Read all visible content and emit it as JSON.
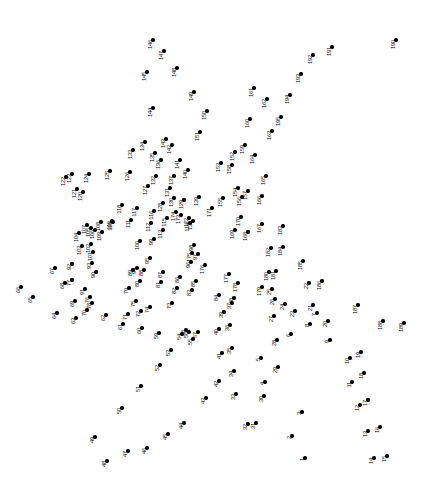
{
  "puzzle": {
    "type": "connect-the-dots",
    "title": "Connect the Dots",
    "total_points": 195,
    "canvas": {
      "width": 426,
      "height": 482
    },
    "dot_color": "#000000",
    "label_color": "#000000",
    "background_color": "#ffffff",
    "label_rotation_deg": -90,
    "points": [
      {
        "n": "1",
        "x": 305,
        "y": 458
      },
      {
        "n": "2",
        "x": 292,
        "y": 436
      },
      {
        "n": "3",
        "x": 302,
        "y": 412
      },
      {
        "n": "4",
        "x": 265,
        "y": 382
      },
      {
        "n": "5",
        "x": 261,
        "y": 358
      },
      {
        "n": "6",
        "x": 291,
        "y": 334
      },
      {
        "n": "7",
        "x": 317,
        "y": 313
      },
      {
        "n": "8",
        "x": 310,
        "y": 324
      },
      {
        "n": "9",
        "x": 330,
        "y": 340
      },
      {
        "n": "10",
        "x": 350,
        "y": 358
      },
      {
        "n": "11",
        "x": 352,
        "y": 382
      },
      {
        "n": "12",
        "x": 360,
        "y": 405
      },
      {
        "n": "13",
        "x": 368,
        "y": 431
      },
      {
        "n": "14",
        "x": 374,
        "y": 458
      },
      {
        "n": "15",
        "x": 387,
        "y": 456
      },
      {
        "n": "16",
        "x": 380,
        "y": 427
      },
      {
        "n": "17",
        "x": 368,
        "y": 400
      },
      {
        "n": "18",
        "x": 364,
        "y": 373
      },
      {
        "n": "19",
        "x": 361,
        "y": 352
      },
      {
        "n": "20",
        "x": 328,
        "y": 321
      },
      {
        "n": "21",
        "x": 313,
        "y": 305
      },
      {
        "n": "22",
        "x": 309,
        "y": 283
      },
      {
        "n": "23",
        "x": 295,
        "y": 311
      },
      {
        "n": "24",
        "x": 285,
        "y": 304
      },
      {
        "n": "25",
        "x": 272,
        "y": 289
      },
      {
        "n": "26",
        "x": 275,
        "y": 299
      },
      {
        "n": "27",
        "x": 274,
        "y": 316
      },
      {
        "n": "28",
        "x": 277,
        "y": 340
      },
      {
        "n": "29",
        "x": 278,
        "y": 367
      },
      {
        "n": "30",
        "x": 264,
        "y": 396
      },
      {
        "n": "31",
        "x": 256,
        "y": 423
      },
      {
        "n": "32",
        "x": 248,
        "y": 424
      },
      {
        "n": "33",
        "x": 236,
        "y": 394
      },
      {
        "n": "34",
        "x": 234,
        "y": 371
      },
      {
        "n": "35",
        "x": 232,
        "y": 348
      },
      {
        "n": "36",
        "x": 230,
        "y": 325
      },
      {
        "n": "37",
        "x": 232,
        "y": 303
      },
      {
        "n": "38",
        "x": 234,
        "y": 298
      },
      {
        "n": "39",
        "x": 224,
        "y": 312
      },
      {
        "n": "40",
        "x": 219,
        "y": 329
      },
      {
        "n": "41",
        "x": 222,
        "y": 353
      },
      {
        "n": "42",
        "x": 219,
        "y": 381
      },
      {
        "n": "43",
        "x": 206,
        "y": 398
      },
      {
        "n": "44",
        "x": 184,
        "y": 423
      },
      {
        "n": "45",
        "x": 168,
        "y": 434
      },
      {
        "n": "46",
        "x": 147,
        "y": 448
      },
      {
        "n": "47",
        "x": 128,
        "y": 451
      },
      {
        "n": "48",
        "x": 107,
        "y": 461
      },
      {
        "n": "49",
        "x": 95,
        "y": 437
      },
      {
        "n": "50",
        "x": 122,
        "y": 408
      },
      {
        "n": "51",
        "x": 141,
        "y": 386
      },
      {
        "n": "52",
        "x": 160,
        "y": 365
      },
      {
        "n": "53",
        "x": 171,
        "y": 350
      },
      {
        "n": "54",
        "x": 182,
        "y": 334
      },
      {
        "n": "55",
        "x": 193,
        "y": 339
      },
      {
        "n": "56",
        "x": 189,
        "y": 332
      },
      {
        "n": "57",
        "x": 198,
        "y": 332
      },
      {
        "n": "58",
        "x": 186,
        "y": 330
      },
      {
        "n": "59",
        "x": 159,
        "y": 333
      },
      {
        "n": "60",
        "x": 142,
        "y": 328
      },
      {
        "n": "61",
        "x": 123,
        "y": 324
      },
      {
        "n": "62",
        "x": 106,
        "y": 315
      },
      {
        "n": "63",
        "x": 76,
        "y": 318
      },
      {
        "n": "64",
        "x": 57,
        "y": 313
      },
      {
        "n": "65",
        "x": 33,
        "y": 297
      },
      {
        "n": "66",
        "x": 21,
        "y": 287
      },
      {
        "n": "67",
        "x": 55,
        "y": 268
      },
      {
        "n": "68",
        "x": 65,
        "y": 283
      },
      {
        "n": "69",
        "x": 75,
        "y": 301
      },
      {
        "n": "70",
        "x": 87,
        "y": 310
      },
      {
        "n": "71",
        "x": 128,
        "y": 314
      },
      {
        "n": "72",
        "x": 141,
        "y": 311
      },
      {
        "n": "73",
        "x": 172,
        "y": 303
      },
      {
        "n": "74",
        "x": 150,
        "y": 307
      },
      {
        "n": "75",
        "x": 136,
        "y": 301
      },
      {
        "n": "76",
        "x": 90,
        "y": 297
      },
      {
        "n": "77",
        "x": 72,
        "y": 280
      },
      {
        "n": "78",
        "x": 92,
        "y": 303
      },
      {
        "n": "79",
        "x": 129,
        "y": 288
      },
      {
        "n": "80",
        "x": 140,
        "y": 281
      },
      {
        "n": "81",
        "x": 161,
        "y": 282
      },
      {
        "n": "82",
        "x": 177,
        "y": 288
      },
      {
        "n": "83",
        "x": 192,
        "y": 290
      },
      {
        "n": "84",
        "x": 219,
        "y": 295
      },
      {
        "n": "85",
        "x": 196,
        "y": 281
      },
      {
        "n": "86",
        "x": 180,
        "y": 277
      },
      {
        "n": "87",
        "x": 163,
        "y": 272
      },
      {
        "n": "88",
        "x": 144,
        "y": 270
      },
      {
        "n": "89",
        "x": 133,
        "y": 270
      },
      {
        "n": "90",
        "x": 96,
        "y": 272
      },
      {
        "n": "91",
        "x": 85,
        "y": 289
      },
      {
        "n": "92",
        "x": 72,
        "y": 264
      },
      {
        "n": "93",
        "x": 92,
        "y": 263
      },
      {
        "n": "94",
        "x": 137,
        "y": 268
      },
      {
        "n": "95",
        "x": 150,
        "y": 258
      },
      {
        "n": "96",
        "x": 191,
        "y": 262
      },
      {
        "n": "97",
        "x": 198,
        "y": 254
      },
      {
        "n": "98",
        "x": 194,
        "y": 245
      },
      {
        "n": "99",
        "x": 154,
        "y": 239
      },
      {
        "n": "100",
        "x": 140,
        "y": 241
      },
      {
        "n": "101",
        "x": 93,
        "y": 252
      },
      {
        "n": "102",
        "x": 91,
        "y": 244
      },
      {
        "n": "103",
        "x": 82,
        "y": 246
      },
      {
        "n": "104",
        "x": 79,
        "y": 233
      },
      {
        "n": "105",
        "x": 91,
        "y": 228
      },
      {
        "n": "106",
        "x": 95,
        "y": 230
      },
      {
        "n": "107",
        "x": 87,
        "y": 225
      },
      {
        "n": "108",
        "x": 101,
        "y": 222
      },
      {
        "n": "109",
        "x": 102,
        "y": 232
      },
      {
        "n": "110",
        "x": 112,
        "y": 221
      },
      {
        "n": "111",
        "x": 131,
        "y": 220
      },
      {
        "n": "112",
        "x": 151,
        "y": 223
      },
      {
        "n": "113",
        "x": 163,
        "y": 230
      },
      {
        "n": "114",
        "x": 190,
        "y": 223
      },
      {
        "n": "115",
        "x": 167,
        "y": 218
      },
      {
        "n": "116",
        "x": 154,
        "y": 211
      },
      {
        "n": "117",
        "x": 137,
        "y": 208
      },
      {
        "n": "118",
        "x": 122,
        "y": 205
      },
      {
        "n": "119",
        "x": 113,
        "y": 222
      },
      {
        "n": "120",
        "x": 83,
        "y": 192
      },
      {
        "n": "121",
        "x": 77,
        "y": 189
      },
      {
        "n": "122",
        "x": 66,
        "y": 177
      },
      {
        "n": "123",
        "x": 72,
        "y": 174
      },
      {
        "n": "124",
        "x": 89,
        "y": 174
      },
      {
        "n": "125",
        "x": 110,
        "y": 171
      },
      {
        "n": "126",
        "x": 130,
        "y": 172
      },
      {
        "n": "127",
        "x": 148,
        "y": 186
      },
      {
        "n": "128",
        "x": 163,
        "y": 203
      },
      {
        "n": "129",
        "x": 184,
        "y": 200
      },
      {
        "n": "130",
        "x": 174,
        "y": 198
      },
      {
        "n": "131",
        "x": 170,
        "y": 188
      },
      {
        "n": "132",
        "x": 156,
        "y": 176
      },
      {
        "n": "133",
        "x": 133,
        "y": 150
      },
      {
        "n": "134",
        "x": 145,
        "y": 142
      },
      {
        "n": "135",
        "x": 155,
        "y": 153
      },
      {
        "n": "136",
        "x": 161,
        "y": 160
      },
      {
        "n": "137",
        "x": 174,
        "y": 176
      },
      {
        "n": "138",
        "x": 193,
        "y": 221
      },
      {
        "n": "139",
        "x": 199,
        "y": 197
      },
      {
        "n": "140",
        "x": 188,
        "y": 170
      },
      {
        "n": "141",
        "x": 180,
        "y": 160
      },
      {
        "n": "142",
        "x": 172,
        "y": 145
      },
      {
        "n": "143",
        "x": 166,
        "y": 139
      },
      {
        "n": "144",
        "x": 153,
        "y": 108
      },
      {
        "n": "145",
        "x": 147,
        "y": 72
      },
      {
        "n": "146",
        "x": 153,
        "y": 40
      },
      {
        "n": "147",
        "x": 164,
        "y": 51
      },
      {
        "n": "148",
        "x": 177,
        "y": 68
      },
      {
        "n": "149",
        "x": 194,
        "y": 92
      },
      {
        "n": "150",
        "x": 207,
        "y": 111
      },
      {
        "n": "151",
        "x": 200,
        "y": 132
      },
      {
        "n": "152",
        "x": 235,
        "y": 152
      },
      {
        "n": "153",
        "x": 221,
        "y": 163
      },
      {
        "n": "154",
        "x": 238,
        "y": 188
      },
      {
        "n": "155",
        "x": 223,
        "y": 198
      },
      {
        "n": "156",
        "x": 242,
        "y": 197
      },
      {
        "n": "157",
        "x": 248,
        "y": 191
      },
      {
        "n": "158",
        "x": 232,
        "y": 165
      },
      {
        "n": "159",
        "x": 245,
        "y": 145
      },
      {
        "n": "160",
        "x": 250,
        "y": 119
      },
      {
        "n": "161",
        "x": 254,
        "y": 88
      },
      {
        "n": "162",
        "x": 267,
        "y": 99
      },
      {
        "n": "163",
        "x": 272,
        "y": 131
      },
      {
        "n": "164",
        "x": 255,
        "y": 155
      },
      {
        "n": "165",
        "x": 266,
        "y": 176
      },
      {
        "n": "166",
        "x": 262,
        "y": 196
      },
      {
        "n": "167",
        "x": 262,
        "y": 224
      },
      {
        "n": "168",
        "x": 248,
        "y": 232
      },
      {
        "n": "169",
        "x": 235,
        "y": 230
      },
      {
        "n": "170",
        "x": 241,
        "y": 217
      },
      {
        "n": "171",
        "x": 212,
        "y": 208
      },
      {
        "n": "172",
        "x": 189,
        "y": 218
      },
      {
        "n": "173",
        "x": 181,
        "y": 215
      },
      {
        "n": "174",
        "x": 176,
        "y": 212
      },
      {
        "n": "175",
        "x": 192,
        "y": 253
      },
      {
        "n": "176",
        "x": 205,
        "y": 265
      },
      {
        "n": "177",
        "x": 229,
        "y": 274
      },
      {
        "n": "178",
        "x": 238,
        "y": 283
      },
      {
        "n": "179",
        "x": 262,
        "y": 287
      },
      {
        "n": "180",
        "x": 269,
        "y": 272
      },
      {
        "n": "181",
        "x": 276,
        "y": 271
      },
      {
        "n": "182",
        "x": 271,
        "y": 248
      },
      {
        "n": "183",
        "x": 283,
        "y": 226
      },
      {
        "n": "184",
        "x": 283,
        "y": 247
      },
      {
        "n": "185",
        "x": 303,
        "y": 261
      },
      {
        "n": "186",
        "x": 322,
        "y": 281
      },
      {
        "n": "187",
        "x": 358,
        "y": 305
      },
      {
        "n": "188",
        "x": 383,
        "y": 321
      },
      {
        "n": "189",
        "x": 404,
        "y": 323
      },
      {
        "n": "190",
        "x": 396,
        "y": 40
      },
      {
        "n": "191",
        "x": 332,
        "y": 47
      },
      {
        "n": "192",
        "x": 313,
        "y": 55
      },
      {
        "n": "193",
        "x": 301,
        "y": 74
      },
      {
        "n": "194",
        "x": 290,
        "y": 95
      },
      {
        "n": "195",
        "x": 281,
        "y": 117
      }
    ]
  }
}
